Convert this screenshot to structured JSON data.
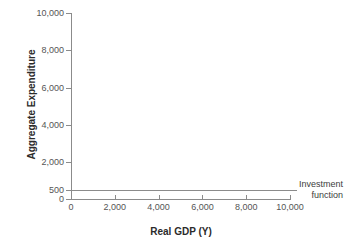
{
  "chart_data": {
    "type": "line",
    "title": "",
    "xlabel": "Real GDP (Y)",
    "ylabel": "Aggregate Expenditure",
    "xlim": [
      0,
      10000
    ],
    "ylim": [
      0,
      10000
    ],
    "grid": false,
    "legend_position": "right-inline",
    "xticks": [
      {
        "value": 0,
        "label": "0"
      },
      {
        "value": 2000,
        "label": "2,000"
      },
      {
        "value": 4000,
        "label": "4,000"
      },
      {
        "value": 6000,
        "label": "6,000"
      },
      {
        "value": 8000,
        "label": "8,000"
      },
      {
        "value": 10000,
        "label": "10,000"
      }
    ],
    "yticks": [
      {
        "value": 10000,
        "label": "10,000"
      },
      {
        "value": 8000,
        "label": "8,000"
      },
      {
        "value": 6000,
        "label": "6,000"
      },
      {
        "value": 4000,
        "label": "4,000"
      },
      {
        "value": 2000,
        "label": "2,000"
      },
      {
        "value": 500,
        "label": "500"
      },
      {
        "value": 0,
        "label": "0"
      }
    ],
    "series": [
      {
        "name": "Investment function",
        "constant_value": 500,
        "x": [
          0,
          10000
        ],
        "values": [
          500,
          500
        ],
        "color": "#8b8b8b"
      }
    ],
    "annotations": [
      {
        "name": "investment-function-label",
        "line1": "Investment",
        "line2": "function",
        "points_to_series": "Investment function"
      }
    ]
  },
  "colors": {
    "axis": "#8b8b8b",
    "tick_text": "#555555",
    "title_text": "#2b2b2b",
    "series_line": "#8b8b8b",
    "background": "#ffffff"
  }
}
